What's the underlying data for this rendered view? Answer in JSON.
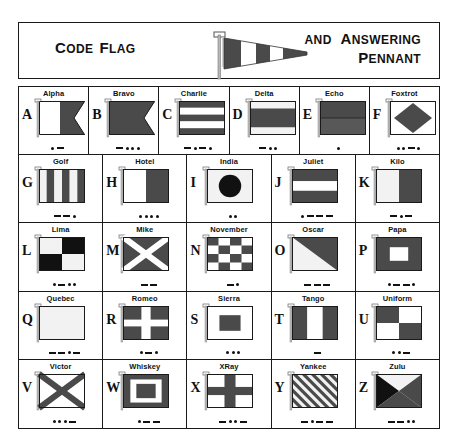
{
  "header": {
    "left_title": {
      "lead": "C",
      "rest": "ODE",
      "lead2": "F",
      "rest2": "LAG"
    },
    "right_line1": {
      "and": "AND",
      "lead": "A",
      "rest": "NSWERING"
    },
    "right_line2": {
      "lead": "P",
      "rest": "ENNANT"
    },
    "pennant_name": "answering-pennant"
  },
  "colors": {
    "red": "#4a4a4a",
    "blue": "#4a4a4a",
    "yellow": "#f2f2f2",
    "white": "#ffffff",
    "black": "#111111",
    "outline": "#1a1a1a",
    "ink": "#111111"
  },
  "flags": [
    {
      "letter": "A",
      "name": "Alpha",
      "morse": [
        ".",
        "-"
      ],
      "design": "alpha"
    },
    {
      "letter": "B",
      "name": "Bravo",
      "morse": [
        "-",
        ".",
        ".",
        "."
      ],
      "design": "bravo"
    },
    {
      "letter": "C",
      "name": "Charlie",
      "morse": [
        "-",
        ".",
        "-",
        "."
      ],
      "design": "charlie"
    },
    {
      "letter": "D",
      "name": "Delta",
      "morse": [
        "-",
        ".",
        "."
      ],
      "design": "delta"
    },
    {
      "letter": "E",
      "name": "Echo",
      "morse": [
        "."
      ],
      "design": "echo"
    },
    {
      "letter": "F",
      "name": "Foxtrot",
      "morse": [
        ".",
        ".",
        "-",
        "."
      ],
      "design": "foxtrot"
    },
    {
      "letter": "G",
      "name": "Golf",
      "morse": [
        "-",
        "-",
        "."
      ],
      "design": "golf"
    },
    {
      "letter": "H",
      "name": "Hotel",
      "morse": [
        ".",
        ".",
        ".",
        "."
      ],
      "design": "hotel"
    },
    {
      "letter": "I",
      "name": "India",
      "morse": [
        ".",
        "."
      ],
      "design": "india"
    },
    {
      "letter": "J",
      "name": "Juliet",
      "morse": [
        ".",
        "-",
        "-",
        "-"
      ],
      "design": "juliet"
    },
    {
      "letter": "K",
      "name": "Kilo",
      "morse": [
        "-",
        ".",
        "-"
      ],
      "design": "kilo"
    },
    {
      "letter": "L",
      "name": "Lima",
      "morse": [
        ".",
        "-",
        ".",
        "."
      ],
      "design": "lima"
    },
    {
      "letter": "M",
      "name": "Mike",
      "morse": [
        "-",
        "-"
      ],
      "design": "mike"
    },
    {
      "letter": "N",
      "name": "November",
      "morse": [
        "-",
        "."
      ],
      "design": "november"
    },
    {
      "letter": "O",
      "name": "Oscar",
      "morse": [
        "-",
        "-",
        "-"
      ],
      "design": "oscar"
    },
    {
      "letter": "P",
      "name": "Papa",
      "morse": [
        ".",
        "-",
        "-",
        "."
      ],
      "design": "papa"
    },
    {
      "letter": "Q",
      "name": "Quebec",
      "morse": [
        "-",
        "-",
        ".",
        "-"
      ],
      "design": "quebec"
    },
    {
      "letter": "R",
      "name": "Romeo",
      "morse": [
        ".",
        "-",
        "."
      ],
      "design": "romeo"
    },
    {
      "letter": "S",
      "name": "Sierra",
      "morse": [
        ".",
        ".",
        "."
      ],
      "design": "sierra"
    },
    {
      "letter": "T",
      "name": "Tango",
      "morse": [
        "-"
      ],
      "design": "tango"
    },
    {
      "letter": "U",
      "name": "Uniform",
      "morse": [
        ".",
        ".",
        "-"
      ],
      "design": "uniform"
    },
    {
      "letter": "V",
      "name": "Victor",
      "morse": [
        ".",
        ".",
        ".",
        "-"
      ],
      "design": "victor"
    },
    {
      "letter": "W",
      "name": "Whiskey",
      "morse": [
        ".",
        "-",
        "-"
      ],
      "design": "whiskey"
    },
    {
      "letter": "X",
      "name": "XRay",
      "morse": [
        "-",
        ".",
        ".",
        "-"
      ],
      "design": "xray"
    },
    {
      "letter": "Y",
      "name": "Yankee",
      "morse": [
        "-",
        ".",
        "-",
        "-"
      ],
      "design": "yankee"
    },
    {
      "letter": "Z",
      "name": "Zulu",
      "morse": [
        "-",
        "-",
        ".",
        "."
      ],
      "design": "zulu"
    }
  ],
  "grid_layout": {
    "rows": 5,
    "cols_row1": 6,
    "cols_other": 5
  }
}
